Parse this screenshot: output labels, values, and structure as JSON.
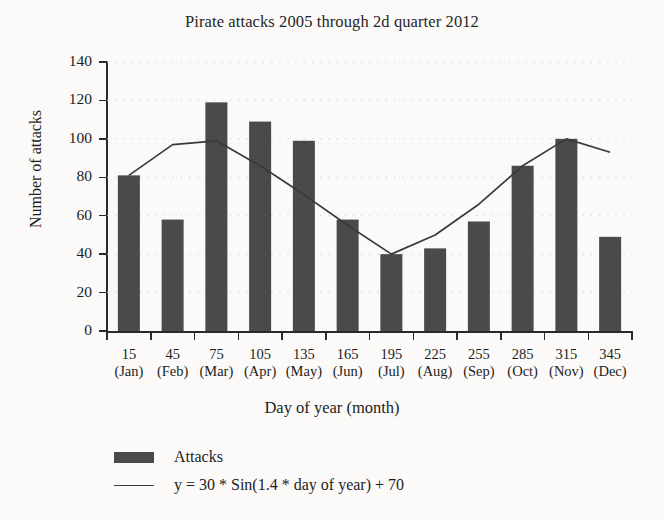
{
  "chart_data": {
    "type": "bar",
    "title": "Pirate attacks 2005 through 2d quarter 2012",
    "xlabel": "Day of year (month)",
    "ylabel": "Number of attacks",
    "categories": [
      "15",
      "45",
      "75",
      "105",
      "135",
      "165",
      "195",
      "225",
      "255",
      "285",
      "315",
      "345"
    ],
    "category_months": [
      "(Jan)",
      "(Feb)",
      "(Mar)",
      "(Apr)",
      "(May)",
      "(Jun)",
      "(Jul)",
      "(Aug)",
      "(Sep)",
      "(Oct)",
      "(Nov)",
      "(Dec)"
    ],
    "x": [
      15,
      45,
      75,
      105,
      135,
      165,
      195,
      225,
      255,
      285,
      315,
      345
    ],
    "values": [
      81,
      58,
      119,
      109,
      99,
      58,
      40,
      43,
      57,
      86,
      100,
      49
    ],
    "series": [
      {
        "name": "Attacks",
        "type": "bar",
        "values": [
          81,
          58,
          119,
          109,
          99,
          58,
          40,
          43,
          57,
          86,
          100,
          49
        ]
      },
      {
        "name": "y = 30 * Sin(1.4 * day of year) + 70",
        "type": "line",
        "values": [
          81,
          97,
          99,
          86,
          71,
          55,
          40,
          50,
          66,
          86,
          100,
          93
        ]
      }
    ],
    "ylim": [
      0,
      140
    ],
    "yticks": [
      0,
      20,
      40,
      60,
      80,
      100,
      120,
      140
    ],
    "ytick_labels": [
      "0",
      "20",
      "40",
      "60",
      "80",
      "100",
      "120",
      "140"
    ],
    "grid": "dotted-horizontal",
    "legend_position": "below-left",
    "colors": {
      "bar": "#4a4a4a",
      "line": "#3a3a3a",
      "axis": "#2a2a2a",
      "grid": "#c9c9c4",
      "background": "#fbfaf8",
      "text": "#1d1d1d"
    }
  },
  "legend": {
    "entries": [
      {
        "label": "Attacks",
        "swatch": "bar-swatch"
      },
      {
        "label": "y = 30 * Sin(1.4 * day of year) + 70",
        "swatch": "line-swatch"
      }
    ]
  }
}
